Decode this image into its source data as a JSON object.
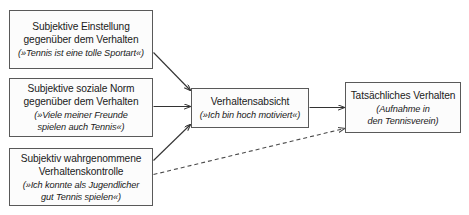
{
  "diagram": {
    "type": "flow-diagram",
    "title_visible": false,
    "background_color": "#ffffff",
    "node_fill": "#fcfcfc",
    "node_border_color": "#595959",
    "arrow_color": "#333333",
    "nodes": [
      {
        "id": "attitude",
        "title_line1": "Subjektive Einstellung",
        "title_line2": "gegenüber dem Verhalten",
        "example_line1": "(»Tennis ist eine tolle Sportart«)",
        "example_line2": ""
      },
      {
        "id": "norm",
        "title_line1": "Subjektive soziale Norm",
        "title_line2": "gegenüber dem Verhalten",
        "example_line1": "(»Viele meiner Freunde",
        "example_line2": "spielen auch Tennis«)"
      },
      {
        "id": "control",
        "title_line1": "Subjektiv wahrgenommene",
        "title_line2": "Verhaltenskontrolle",
        "example_line1": "(»Ich konnte als Jugendlicher",
        "example_line2": "gut Tennis spielen«)"
      },
      {
        "id": "intention",
        "title_line1": "Verhaltensabsicht",
        "title_line2": "",
        "example_line1": "(»Ich bin hoch motiviert«)",
        "example_line2": ""
      },
      {
        "id": "behavior",
        "title_line1": "Tatsächliches Verhalten",
        "title_line2": "",
        "example_line1": "(Aufnahme in",
        "example_line2": "den Tennisverein)"
      }
    ],
    "edges": [
      {
        "id": "attitude-to-intention",
        "from": "attitude",
        "to": "intention",
        "style": "solid"
      },
      {
        "id": "norm-to-intention",
        "from": "norm",
        "to": "intention",
        "style": "solid"
      },
      {
        "id": "control-to-intention",
        "from": "control",
        "to": "intention",
        "style": "solid"
      },
      {
        "id": "intention-to-behavior",
        "from": "intention",
        "to": "behavior",
        "style": "solid"
      },
      {
        "id": "control-to-behavior",
        "from": "control",
        "to": "behavior",
        "style": "dashed"
      }
    ]
  }
}
